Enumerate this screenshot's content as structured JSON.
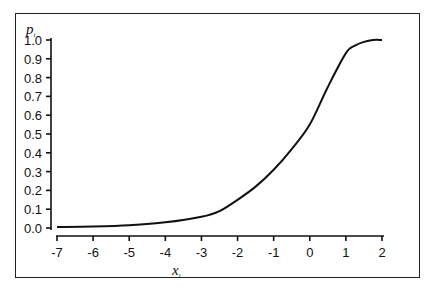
{
  "chart_data": {
    "type": "line",
    "title": "",
    "xlabel": "x_i",
    "ylabel": "p_i",
    "xlim": [
      -7,
      2
    ],
    "ylim": [
      0.0,
      1.0
    ],
    "grid": false,
    "legend": null,
    "x_ticks": [
      "-7",
      "-6",
      "-5",
      "-4",
      "-3",
      "-2",
      "-1",
      "0",
      "1",
      "2"
    ],
    "y_ticks": [
      "0.0",
      "0.1",
      "0.2",
      "0.3",
      "0.4",
      "0.5",
      "0.6",
      "0.7",
      "0.8",
      "0.9",
      "1.0"
    ],
    "series": [
      {
        "name": "p_i",
        "x": [
          -7,
          -6,
          -5,
          -4,
          -3,
          -2.5,
          -2,
          -1.5,
          -1,
          -0.5,
          0,
          0.5,
          1,
          1.25,
          1.5,
          1.75,
          2
        ],
        "y": [
          0.005,
          0.008,
          0.015,
          0.03,
          0.06,
          0.09,
          0.15,
          0.22,
          0.31,
          0.42,
          0.55,
          0.75,
          0.93,
          0.97,
          0.99,
          1.0,
          1.0
        ]
      }
    ]
  },
  "axes": {
    "y_var": "p",
    "y_sub": "i",
    "x_var": "x",
    "x_sub": "i"
  }
}
